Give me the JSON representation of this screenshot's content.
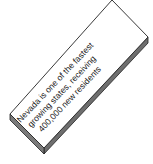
{
  "illustration": {
    "type": "3d-label-box",
    "lines": [
      "Nevada is one of the fastest",
      "growing states, receiving",
      "400,000 new residents"
    ],
    "colors": {
      "top_face": "#ffffff",
      "side_face": "#6e6e6e",
      "outline": "#222222",
      "text": "#1a1a1a"
    }
  }
}
